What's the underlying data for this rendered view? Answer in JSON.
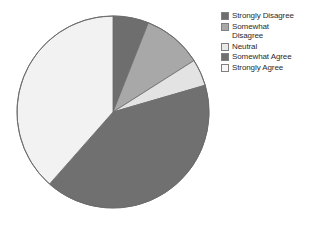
{
  "chart_data": {
    "type": "pie",
    "title": "",
    "categories": [
      "Strongly Disagree",
      "Somewhat Disagree",
      "Neutral",
      "Somewhat Agree",
      "Strongly Agree"
    ],
    "values": [
      6,
      10,
      4.5,
      41,
      38
    ],
    "units": "percent",
    "start_angle_deg": 0,
    "direction": "clockwise",
    "colors": [
      "#6e6e6e",
      "#a8a8a8",
      "#e3e3e3",
      "#707070",
      "#f2f2f2"
    ],
    "legend_position": "right",
    "grid": false,
    "xlabel": "",
    "ylabel": "",
    "slices": [
      {
        "label": "Strongly Disagree",
        "value": 6,
        "color": "#6e6e6e",
        "start_deg": 0,
        "end_deg": 21.6
      },
      {
        "label": "Somewhat Disagree",
        "value": 10,
        "color": "#a8a8a8",
        "start_deg": 21.6,
        "end_deg": 57.6
      },
      {
        "label": "Neutral",
        "value": 4.5,
        "color": "#e3e3e3",
        "start_deg": 57.6,
        "end_deg": 73.8
      },
      {
        "label": "Somewhat Agree",
        "value": 41,
        "color": "#707070",
        "start_deg": 73.8,
        "end_deg": 221.4
      },
      {
        "label": "Strongly Agree",
        "value": 38,
        "color": "#f2f2f2",
        "start_deg": 221.4,
        "end_deg": 360
      }
    ]
  },
  "legend": {
    "items": [
      {
        "label": "Strongly Disagree",
        "color": "#6e6e6e"
      },
      {
        "label": "Somewhat\nDisagree",
        "color": "#a8a8a8"
      },
      {
        "label": "Neutral",
        "color": "#e8e8e8"
      },
      {
        "label": "Somewhat Agree",
        "color": "#707070"
      },
      {
        "label": "Strongly Agree",
        "color": "#f7f7f7"
      }
    ]
  },
  "pie_geometry": {
    "center_x": 113,
    "center_y": 112,
    "radius": 96,
    "outline_color": "#6b6b6b"
  }
}
